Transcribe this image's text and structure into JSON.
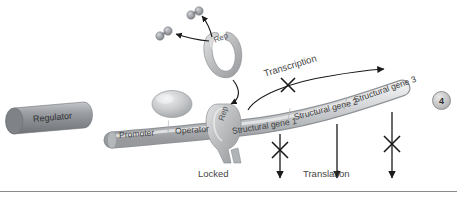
{
  "figure": {
    "badge_number": "4",
    "state": "Locked"
  },
  "dna": {
    "regulator_label": "Regulator",
    "promoter_label": "Promoter",
    "operator_label": "Operator",
    "structural_genes": [
      "Structural gene 1",
      "Structural gene 2",
      "Structural gene 3"
    ]
  },
  "repressor": {
    "free_label": "Rep",
    "bound_label": "Rep",
    "locked_label": "Locked"
  },
  "processes": {
    "transcription_label": "Transcription",
    "translation_label": "Translation"
  },
  "colors": {
    "background": "#ffffff",
    "dna_strand": "#c9cbcd",
    "regulator": "#8e9094",
    "repressor": "#b3b5b7",
    "polymerase": "#c4c6c8",
    "inducer": "#9fa2a6",
    "text": "#3a3a3a",
    "arrow": "#1a1a1a",
    "baseline": "#8a8a8a"
  },
  "icons": {
    "inducer": "inducer-molecule-icon",
    "polymerase": "rna-polymerase-icon",
    "block": "blocked-x-icon"
  }
}
